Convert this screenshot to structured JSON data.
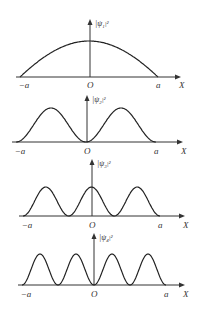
{
  "figure": {
    "panels": [
      {
        "id": "psi1",
        "ylabel_base": "|ψ",
        "ylabel_sub": "1",
        "ylabel_sup": "|²",
        "x_left": "−a",
        "x_origin": "O",
        "x_right": "a",
        "x_axis": "X",
        "n": 1
      },
      {
        "id": "psi2",
        "ylabel_base": "|ψ",
        "ylabel_sub": "2",
        "ylabel_sup": "|²",
        "x_left": "−a",
        "x_origin": "O",
        "x_right": "a",
        "x_axis": "X",
        "n": 2
      },
      {
        "id": "psi3",
        "ylabel_base": "|ψ",
        "ylabel_sub": "3",
        "ylabel_sup": "|²",
        "x_left": "−a",
        "x_origin": "O",
        "x_right": "a",
        "x_axis": "X",
        "n": 3
      },
      {
        "id": "psi4",
        "ylabel_base": "|ψ",
        "ylabel_sub": "4",
        "ylabel_sup": "|²",
        "x_left": "−a",
        "x_origin": "O",
        "x_right": "a",
        "x_axis": "X",
        "n": 4
      }
    ]
  },
  "colors": {
    "line": "#222222",
    "axis": "#333333",
    "background": "#ffffff"
  }
}
